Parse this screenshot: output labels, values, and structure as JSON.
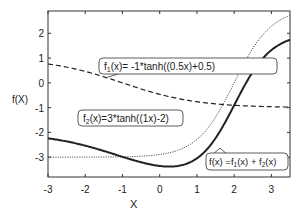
{
  "chart_data": {
    "type": "line",
    "title": "",
    "xlabel": "X",
    "ylabel": "f(X)",
    "xlim": [
      -3,
      3.5
    ],
    "ylim": [
      -3.8,
      2.9
    ],
    "xticks": [
      -3,
      -2,
      -1,
      0,
      1,
      2,
      3
    ],
    "yticks": [
      -3,
      -2,
      -1,
      0,
      1,
      2
    ],
    "grid": false,
    "legend": "none (callout annotations)",
    "series": [
      {
        "name": "f1(x)= -1*tanh((0.5x)+0.5)",
        "style": "dashed",
        "expr": "-tanh(0.5x+0.5)"
      },
      {
        "name": "f2(x)=3*tanh((1x)-2)",
        "style": "dotted",
        "expr": "3*tanh(x-2)"
      },
      {
        "name": "f(x) =f1(x) + f2(x)",
        "style": "solid-thick",
        "expr": "-tanh(0.5x+0.5)+3*tanh(x-2)"
      }
    ],
    "annotations": [
      {
        "label_main": "f",
        "sub": "1",
        "rest": "(x)= -1*tanh((0.5x)+0.5)"
      },
      {
        "label_main": "f",
        "sub": "2",
        "rest": "(x)=3*tanh((1x)-2)"
      },
      {
        "label_main": "f(x) =f",
        "sub": "1",
        "mid": "(x) + f",
        "sub2": "2",
        "rest": "(x)"
      }
    ]
  }
}
